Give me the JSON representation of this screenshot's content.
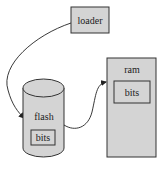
{
  "diagram": {
    "nodes": [
      {
        "id": "loader",
        "label": "loader",
        "shape": "rectangle"
      },
      {
        "id": "flash",
        "label": "flash",
        "shape": "cylinder",
        "contains": [
          "flash_bits"
        ]
      },
      {
        "id": "flash_bits",
        "label": "bits",
        "shape": "rectangle"
      },
      {
        "id": "ram",
        "label": "ram",
        "shape": "rectangle",
        "contains": [
          "ram_bits"
        ]
      },
      {
        "id": "ram_bits",
        "label": "bits",
        "shape": "rectangle"
      }
    ],
    "edges": [
      {
        "from": "loader",
        "to": "flash",
        "style": "curved-arrow"
      },
      {
        "from": "flash",
        "to": "ram",
        "style": "curved-arrow"
      }
    ],
    "colors": {
      "fill": "#d4d4d4",
      "stroke": "#333333",
      "text": "#222222",
      "background": "#ffffff"
    }
  }
}
